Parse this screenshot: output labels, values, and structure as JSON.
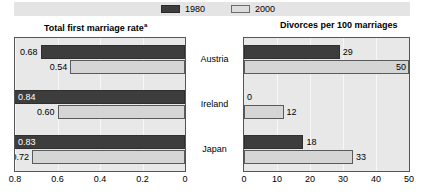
{
  "legend": {
    "entries": [
      {
        "label": "1980",
        "swatch": "dark",
        "color": "#3d3d3d"
      },
      {
        "label": "2000",
        "swatch": "light",
        "color": "#d5d5d5"
      }
    ]
  },
  "panels": {
    "left": {
      "title": "Total first marriage rate",
      "title_superscript": "a"
    },
    "right": {
      "title": "Divorces per 100 marriages",
      "title_superscript": ""
    }
  },
  "categories": [
    "Austria",
    "Ireland",
    "Japan"
  ],
  "chart_data": [
    {
      "type": "bar",
      "title": "Total first marriage rate",
      "title_note": "a",
      "orientation": "horizontal",
      "direction": "right-to-left",
      "categories": [
        "Austria",
        "Ireland",
        "Japan"
      ],
      "series": [
        {
          "name": "1980",
          "values": [
            0.68,
            0.84,
            0.83
          ],
          "color": "#3d3d3d"
        },
        {
          "name": "2000",
          "values": [
            0.54,
            0.6,
            0.72
          ],
          "color": "#d5d5d5"
        }
      ],
      "value_labels": {
        "1980": [
          "0.68",
          "0.84",
          "0.83"
        ],
        "2000": [
          "0.54",
          "0.60",
          "0.72"
        ]
      },
      "xlabel": "",
      "ylabel": "",
      "xlim": [
        0.8,
        0
      ],
      "ticks": [
        "0.8",
        "0.6",
        "0.4",
        "0.2",
        "0"
      ],
      "tick_values": [
        0.8,
        0.6,
        0.4,
        0.2,
        0
      ],
      "grid": true,
      "legend_position": "top"
    },
    {
      "type": "bar",
      "title": "Divorces per 100 marriages",
      "orientation": "horizontal",
      "direction": "left-to-right",
      "categories": [
        "Austria",
        "Ireland",
        "Japan"
      ],
      "series": [
        {
          "name": "1980",
          "values": [
            29,
            0,
            18
          ],
          "color": "#3d3d3d"
        },
        {
          "name": "2000",
          "values": [
            50,
            12,
            33
          ],
          "color": "#d5d5d5"
        }
      ],
      "value_labels": {
        "1980": [
          "29",
          "0",
          "18"
        ],
        "2000": [
          "50",
          "12",
          "33"
        ]
      },
      "xlabel": "",
      "ylabel": "",
      "xlim": [
        0,
        50
      ],
      "ticks": [
        "0",
        "10",
        "20",
        "30",
        "40",
        "50"
      ],
      "tick_values": [
        0,
        10,
        20,
        30,
        40,
        50
      ],
      "grid": true,
      "legend_position": "top"
    }
  ]
}
